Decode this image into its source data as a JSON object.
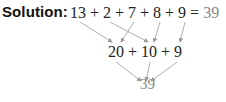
{
  "solution": {
    "label": "Solution:",
    "row1": {
      "expression": "13 + 2 + 7 + 8 + 9 = ",
      "result": "39",
      "terms": [
        "13",
        "2",
        "7",
        "8",
        "9"
      ]
    },
    "row2": {
      "expression": "20 + 10 + 9",
      "terms": [
        "20",
        "10",
        "9"
      ]
    },
    "row3": {
      "result": "39"
    },
    "arrows": [
      {
        "from": "13",
        "to": "20"
      },
      {
        "from": "7",
        "to": "20"
      },
      {
        "from": "2",
        "to": "10"
      },
      {
        "from": "8",
        "to": "10"
      },
      {
        "from": "9",
        "to": "9"
      },
      {
        "from": "20",
        "to": "39"
      },
      {
        "from": "10",
        "to": "39"
      },
      {
        "from": "9",
        "to": "39"
      }
    ],
    "colors": {
      "text": "#222222",
      "result": "#888888",
      "arrow": "#999999"
    }
  }
}
